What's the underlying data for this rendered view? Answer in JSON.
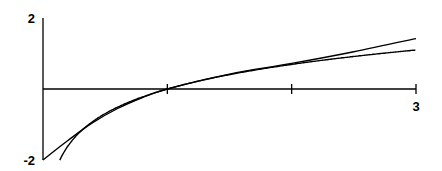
{
  "chart_data": {
    "type": "line",
    "title": "",
    "xlabel": "",
    "ylabel": "",
    "xlim": [
      0,
      3
    ],
    "ylim": [
      -2,
      2
    ],
    "grid": false,
    "legend": "none",
    "x_tick_values": [
      1,
      2,
      3
    ],
    "x_tick_labels": [
      "",
      "",
      "3"
    ],
    "y_tick_labels": [
      {
        "value": 2,
        "label": "2"
      },
      {
        "value": -2,
        "label": "-2"
      }
    ],
    "series": [
      {
        "name": "ln(x)",
        "x": [
          0.135,
          0.2,
          0.3,
          0.4,
          0.5,
          0.6,
          0.8,
          1.0,
          1.25,
          1.5,
          2.0,
          2.5,
          3.0
        ],
        "y": [
          -2.0,
          -1.609,
          -1.204,
          -0.916,
          -0.693,
          -0.511,
          -0.223,
          0.0,
          0.223,
          0.405,
          0.693,
          0.916,
          1.099
        ]
      },
      {
        "name": "approximation",
        "x": [
          0.0,
          0.2,
          0.4,
          0.6,
          0.8,
          1.0,
          1.5,
          2.0,
          2.5,
          3.0
        ],
        "y": [
          -2.0,
          -1.45,
          -0.95,
          -0.55,
          -0.24,
          0.0,
          0.42,
          0.72,
          1.05,
          1.42
        ]
      }
    ]
  }
}
